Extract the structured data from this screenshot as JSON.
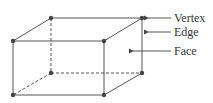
{
  "diagram": {
    "type": "cuboid",
    "vertices": {
      "back_top_left": [
        51,
        18
      ],
      "back_top_right": [
        142,
        18
      ],
      "front_top_left": [
        13,
        41
      ],
      "front_top_right": [
        104,
        41
      ],
      "back_bottom_left": [
        51,
        73
      ],
      "back_bottom_right": [
        142,
        73
      ],
      "front_bottom_left": [
        13,
        95
      ],
      "front_bottom_right": [
        104,
        95
      ]
    },
    "labels": [
      {
        "key": "vertex",
        "text": "Vertex"
      },
      {
        "key": "edge",
        "text": "Edge"
      },
      {
        "key": "face",
        "text": "Face"
      }
    ],
    "colors": {
      "line": "#555555",
      "vertex": "#444444",
      "text": "#333333"
    }
  }
}
